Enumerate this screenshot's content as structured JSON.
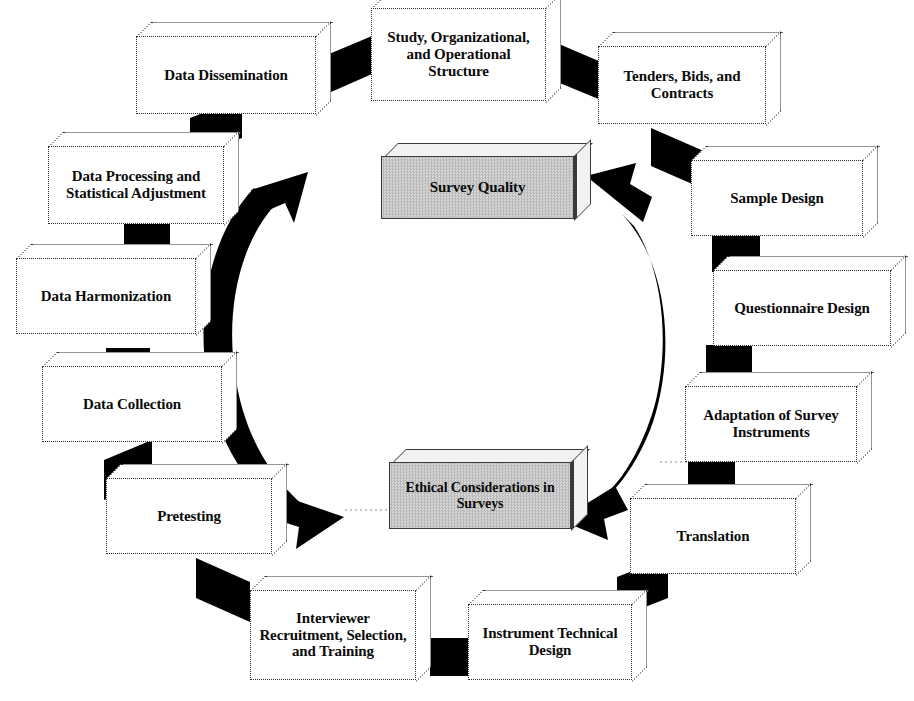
{
  "diagram": {
    "colors": {
      "box_fill": "#ffffff",
      "box_border": "#2b2b2b",
      "highlight_fill": "#cccccc",
      "highlight_border": "#3a3a3a",
      "connector": "#000000",
      "arrow": "#000000",
      "background": "#ffffff"
    },
    "center_nodes": [
      {
        "id": "survey-quality",
        "label": "Survey Quality",
        "shaded": true
      },
      {
        "id": "ethical-considerations",
        "label": "Ethical Considerations in Surveys",
        "shaded": true
      }
    ],
    "cycle_nodes": [
      {
        "id": "study-structure",
        "label": "Study, Organizational, and Operational Structure"
      },
      {
        "id": "tenders-bids-contracts",
        "label": "Tenders, Bids, and Contracts"
      },
      {
        "id": "sample-design",
        "label": "Sample Design"
      },
      {
        "id": "questionnaire-design",
        "label": "Questionnaire Design"
      },
      {
        "id": "adaptation-survey-instruments",
        "label": "Adaptation of Survey Instruments"
      },
      {
        "id": "translation",
        "label": "Translation"
      },
      {
        "id": "instrument-technical-design",
        "label": "Instrument Technical Design"
      },
      {
        "id": "interviewer-recruitment",
        "label": "Interviewer Recruitment, Selection, and Training"
      },
      {
        "id": "pretesting",
        "label": "Pretesting"
      },
      {
        "id": "data-collection",
        "label": "Data Collection"
      },
      {
        "id": "data-harmonization",
        "label": "Data Harmonization"
      },
      {
        "id": "data-processing",
        "label": "Data Processing and Statistical Adjustment"
      },
      {
        "id": "data-dissemination",
        "label": "Data Dissemination"
      }
    ],
    "arrows": [
      {
        "id": "left-arc",
        "from": "cycle",
        "to": "center",
        "heads": "both",
        "direction": "clockwise-inward"
      },
      {
        "id": "right-arc",
        "from": "cycle",
        "to": "center",
        "heads": "both",
        "direction": "counterclockwise-inward"
      }
    ]
  }
}
